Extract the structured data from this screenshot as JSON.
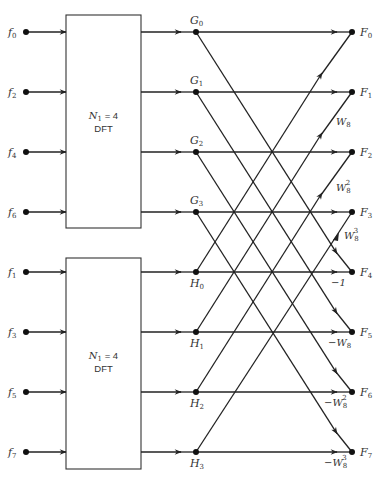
{
  "diagram": {
    "type": "8-point FFT signal flow graph (decimation in time)",
    "inputs": [
      {
        "name": "f",
        "sub": "0"
      },
      {
        "name": "f",
        "sub": "2"
      },
      {
        "name": "f",
        "sub": "4"
      },
      {
        "name": "f",
        "sub": "6"
      },
      {
        "name": "f",
        "sub": "1"
      },
      {
        "name": "f",
        "sub": "3"
      },
      {
        "name": "f",
        "sub": "5"
      },
      {
        "name": "f",
        "sub": "7"
      }
    ],
    "blocks": [
      {
        "line1_var": "N",
        "line1_sub": "1",
        "line1_rest": " = 4",
        "line2": "DFT"
      },
      {
        "line1_var": "N",
        "line1_sub": "1",
        "line1_rest": " = 4",
        "line2": "DFT"
      }
    ],
    "intermediate_G": [
      {
        "name": "G",
        "sub": "0"
      },
      {
        "name": "G",
        "sub": "1"
      },
      {
        "name": "G",
        "sub": "2"
      },
      {
        "name": "G",
        "sub": "3"
      }
    ],
    "intermediate_H": [
      {
        "name": "H",
        "sub": "0"
      },
      {
        "name": "H",
        "sub": "1"
      },
      {
        "name": "H",
        "sub": "2"
      },
      {
        "name": "H",
        "sub": "3"
      }
    ],
    "outputs": [
      {
        "name": "F",
        "sub": "0"
      },
      {
        "name": "F",
        "sub": "1"
      },
      {
        "name": "F",
        "sub": "2"
      },
      {
        "name": "F",
        "sub": "3"
      },
      {
        "name": "F",
        "sub": "4"
      },
      {
        "name": "F",
        "sub": "5"
      },
      {
        "name": "F",
        "sub": "6"
      },
      {
        "name": "F",
        "sub": "7"
      }
    ],
    "twiddles": [
      {
        "prefix": "",
        "base": "W",
        "sub": "8",
        "sup": ""
      },
      {
        "prefix": "",
        "base": "W",
        "sub": "8",
        "sup": "2"
      },
      {
        "prefix": "",
        "base": "W",
        "sub": "8",
        "sup": "3"
      },
      {
        "prefix": "−",
        "base": "1",
        "sub": "",
        "sup": ""
      },
      {
        "prefix": "−",
        "base": "W",
        "sub": "8",
        "sup": ""
      },
      {
        "prefix": "−",
        "base": "W",
        "sub": "8",
        "sup": "2"
      },
      {
        "prefix": "−",
        "base": "W",
        "sub": "8",
        "sup": "3"
      }
    ]
  }
}
